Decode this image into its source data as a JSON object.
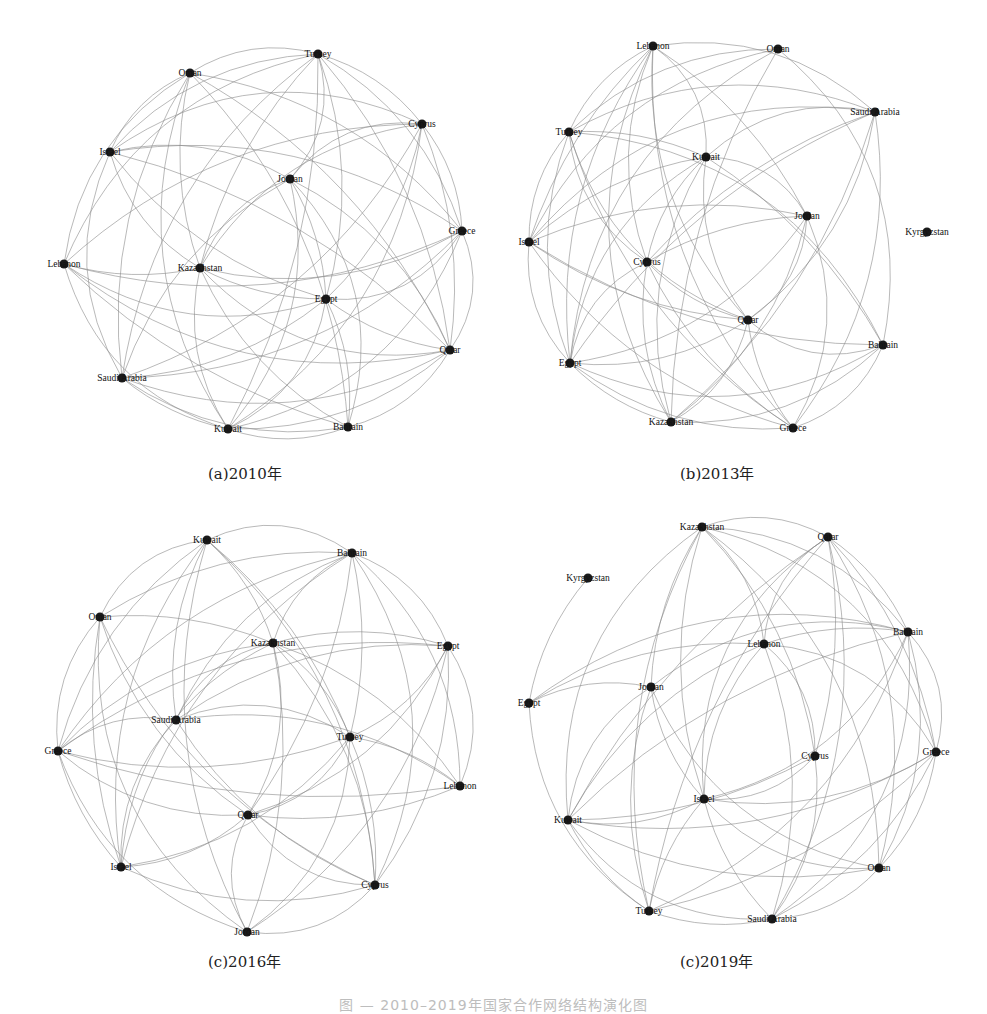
{
  "figure": {
    "panels": [
      {
        "id": "a",
        "caption": "(a)2010年",
        "caption_pos": [
          208,
          470
        ],
        "center": [
          264,
          242
        ],
        "nodes": [
          {
            "label": "Turkey",
            "x": 318,
            "y": 54
          },
          {
            "label": "Oman",
            "x": 190,
            "y": 73
          },
          {
            "label": "Cyprus",
            "x": 422,
            "y": 124
          },
          {
            "label": "Israel",
            "x": 110,
            "y": 152
          },
          {
            "label": "Jordan",
            "x": 290,
            "y": 179
          },
          {
            "label": "Greece",
            "x": 462,
            "y": 231
          },
          {
            "label": "Lebanon",
            "x": 64,
            "y": 264
          },
          {
            "label": "Kazakhstan",
            "x": 200,
            "y": 268
          },
          {
            "label": "Egypt",
            "x": 326,
            "y": 299
          },
          {
            "label": "Qatar",
            "x": 450,
            "y": 350
          },
          {
            "label": "Saudi Arabia",
            "x": 122,
            "y": 378
          },
          {
            "label": "Kuwait",
            "x": 228,
            "y": 429
          },
          {
            "label": "Bahrain",
            "x": 348,
            "y": 427
          }
        ]
      },
      {
        "id": "b",
        "caption": "(b)2013年",
        "caption_pos": [
          680,
          470
        ],
        "center": [
          728,
          240
        ],
        "nodes": [
          {
            "label": "Lebanon",
            "x": 653,
            "y": 46
          },
          {
            "label": "Oman",
            "x": 778,
            "y": 49
          },
          {
            "label": "Saudi Arabia",
            "x": 875,
            "y": 112
          },
          {
            "label": "Turkey",
            "x": 569,
            "y": 132
          },
          {
            "label": "Kuwait",
            "x": 706,
            "y": 157
          },
          {
            "label": "Jordan",
            "x": 807,
            "y": 216
          },
          {
            "label": "Kyrgyzstan",
            "x": 927,
            "y": 232
          },
          {
            "label": "Israel",
            "x": 529,
            "y": 242
          },
          {
            "label": "Cyprus",
            "x": 647,
            "y": 262
          },
          {
            "label": "Qatar",
            "x": 748,
            "y": 320
          },
          {
            "label": "Bahrain",
            "x": 883,
            "y": 345
          },
          {
            "label": "Egypt",
            "x": 570,
            "y": 363
          },
          {
            "label": "Kazakhstan",
            "x": 671,
            "y": 422
          },
          {
            "label": "Greece",
            "x": 793,
            "y": 428
          }
        ],
        "isolated_like": [
          "Kyrgyzstan"
        ]
      },
      {
        "id": "c",
        "caption": "(c)2016年",
        "caption_pos": [
          208,
          958
        ],
        "center": [
          258,
          740
        ],
        "nodes": [
          {
            "label": "Kuwait",
            "x": 207,
            "y": 540
          },
          {
            "label": "Bahrain",
            "x": 352,
            "y": 553
          },
          {
            "label": "Oman",
            "x": 100,
            "y": 617
          },
          {
            "label": "Kazakhstan",
            "x": 273,
            "y": 643
          },
          {
            "label": "Egypt",
            "x": 448,
            "y": 646
          },
          {
            "label": "Saudi Arabia",
            "x": 176,
            "y": 720
          },
          {
            "label": "Turkey",
            "x": 350,
            "y": 737
          },
          {
            "label": "Greece",
            "x": 58,
            "y": 751
          },
          {
            "label": "Lebanon",
            "x": 460,
            "y": 786
          },
          {
            "label": "Qatar",
            "x": 248,
            "y": 815
          },
          {
            "label": "Israel",
            "x": 121,
            "y": 867
          },
          {
            "label": "Cyprus",
            "x": 375,
            "y": 885
          },
          {
            "label": "Jordan",
            "x": 247,
            "y": 932
          }
        ]
      },
      {
        "id": "d",
        "caption": "(c)2019年",
        "caption_pos": [
          680,
          958
        ],
        "center": [
          752,
          726
        ],
        "nodes": [
          {
            "label": "Kazakhstan",
            "x": 702,
            "y": 527
          },
          {
            "label": "Qatar",
            "x": 828,
            "y": 537
          },
          {
            "label": "Kyrgyzstan",
            "x": 588,
            "y": 578
          },
          {
            "label": "Bahrain",
            "x": 908,
            "y": 632
          },
          {
            "label": "Lebanon",
            "x": 764,
            "y": 644
          },
          {
            "label": "Jordan",
            "x": 651,
            "y": 687
          },
          {
            "label": "Egypt",
            "x": 529,
            "y": 703
          },
          {
            "label": "Cyprus",
            "x": 815,
            "y": 756
          },
          {
            "label": "Greece",
            "x": 936,
            "y": 752
          },
          {
            "label": "Israel",
            "x": 704,
            "y": 799
          },
          {
            "label": "Kuwait",
            "x": 568,
            "y": 820
          },
          {
            "label": "Oman",
            "x": 879,
            "y": 868
          },
          {
            "label": "Turkey",
            "x": 649,
            "y": 911
          },
          {
            "label": "Saudi Arabia",
            "x": 772,
            "y": 919
          }
        ],
        "sparse_nodes": {
          "Kyrgyzstan": [
            "Egypt"
          ],
          "Egypt": [
            "Kyrgyzstan",
            "Jordan",
            "Lebanon",
            "Bahrain",
            "Turkey"
          ]
        }
      }
    ],
    "figure_caption": "图 — 2010–2019年国家合作网络结构演化图",
    "style": {
      "edge_color": "#8a8a8a",
      "node_color": "#1a1a1a",
      "background": "#ffffff"
    }
  }
}
